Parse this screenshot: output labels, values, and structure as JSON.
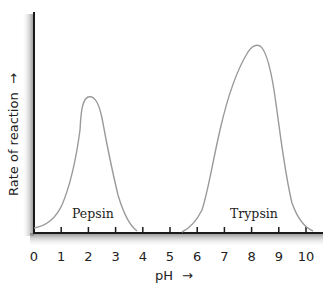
{
  "chart_data": {
    "type": "line",
    "title": "",
    "xlabel": "pH",
    "xlabel_arrow": "→",
    "ylabel": "Rate of reaction",
    "ylabel_arrow": "→",
    "xlim": [
      0,
      10
    ],
    "ylim": [
      0,
      100
    ],
    "x_ticks": [
      "0",
      "1",
      "2",
      "3",
      "4",
      "5",
      "6",
      "7",
      "8",
      "9",
      "10"
    ],
    "y_ticks": [],
    "grid": false,
    "legend": "none (curves labeled inline)",
    "series": [
      {
        "name": "Pepsin",
        "label": "Pepsin",
        "peak_ph": 2.0,
        "peak_rate": 62,
        "x": [
          0.0,
          0.5,
          1.0,
          1.5,
          1.7,
          2.0,
          2.3,
          2.6,
          3.0,
          3.4,
          3.8
        ],
        "y": [
          2,
          7,
          20,
          45,
          58,
          62,
          57,
          40,
          17,
          4,
          0
        ]
      },
      {
        "name": "Trypsin",
        "label": "Trypsin",
        "peak_ph": 8.2,
        "peak_rate": 85,
        "x": [
          5.4,
          6.0,
          6.5,
          7.0,
          7.5,
          8.0,
          8.2,
          8.6,
          9.0,
          9.5,
          10.0,
          10.3
        ],
        "y": [
          0,
          6,
          30,
          58,
          75,
          84,
          85,
          80,
          60,
          25,
          5,
          0
        ]
      }
    ]
  },
  "labels": {
    "pepsin": "Pepsin",
    "trypsin": "Trypsin"
  },
  "colors": {
    "curve": "#9a9a9a",
    "axis": "#1a1a1a",
    "shadow": "#8a8a8a",
    "text": "#222222"
  }
}
